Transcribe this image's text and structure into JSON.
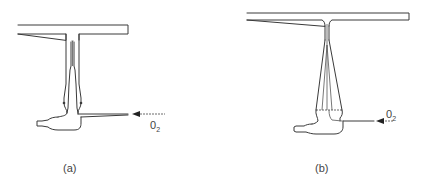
{
  "figures": [
    {
      "id": "a",
      "caption": "(a)",
      "gas_label": "0",
      "gas_subscript": "2",
      "description": "T-shaped burner head with narrow central tube, nebulizer capillary and spray chamber; oxidant gas enters horizontally from the right"
    },
    {
      "id": "b",
      "caption": "(b)",
      "gas_label": "0",
      "gas_subscript": "2",
      "description": "Long slot burner head on a tapered conical stem, nebulizer chamber at base; oxidant gas enters horizontally from the right"
    }
  ],
  "colors": {
    "line": "#3a3a3a",
    "background": "#ffffff"
  }
}
